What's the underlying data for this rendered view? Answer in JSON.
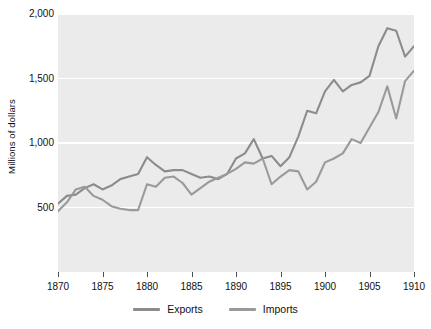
{
  "chart_data": {
    "type": "line",
    "title": "",
    "xlabel": "",
    "ylabel": "Millions of dollars",
    "xlim": [
      1870,
      1910
    ],
    "ylim": [
      0,
      2000
    ],
    "yticks": [
      500,
      1000,
      1500,
      2000
    ],
    "ytick_labels": [
      "500",
      "1,500",
      "1,000",
      "2,000"
    ],
    "xticks": [
      1870,
      1875,
      1880,
      1885,
      1890,
      1895,
      1900,
      1905,
      1910
    ],
    "grid": "horizontal-white-gridlines",
    "legend_position": "bottom-center",
    "plot_background": "#ebebeb",
    "x": [
      1870,
      1871,
      1872,
      1873,
      1874,
      1875,
      1876,
      1877,
      1878,
      1879,
      1880,
      1881,
      1882,
      1883,
      1884,
      1885,
      1886,
      1887,
      1888,
      1889,
      1890,
      1891,
      1892,
      1893,
      1894,
      1895,
      1896,
      1897,
      1898,
      1899,
      1900,
      1901,
      1902,
      1903,
      1904,
      1905,
      1906,
      1907,
      1908,
      1909,
      1910
    ],
    "series": [
      {
        "name": "Exports",
        "color": "#8c8c8c",
        "values": [
          530,
          590,
          600,
          650,
          680,
          640,
          670,
          720,
          740,
          760,
          890,
          830,
          780,
          790,
          790,
          760,
          730,
          740,
          720,
          760,
          880,
          920,
          1030,
          880,
          900,
          820,
          890,
          1050,
          1250,
          1230,
          1400,
          1490,
          1400,
          1450,
          1470,
          1520,
          1750,
          1890,
          1870,
          1670,
          1750
        ]
      },
      {
        "name": "Imports",
        "color": "#9a9a9a",
        "values": [
          470,
          540,
          640,
          660,
          590,
          560,
          510,
          490,
          480,
          480,
          680,
          660,
          730,
          740,
          690,
          600,
          650,
          700,
          730,
          760,
          800,
          850,
          840,
          880,
          680,
          740,
          790,
          780,
          640,
          700,
          850,
          880,
          920,
          1030,
          1000,
          1120,
          1240,
          1440,
          1190,
          1480,
          1560
        ]
      }
    ]
  },
  "axes": {
    "ylabel": "Millions of dollars",
    "ytick_labels": [
      "2,000",
      "1,500",
      "1,000",
      "500"
    ],
    "xtick_labels": [
      "1870",
      "1875",
      "1880",
      "1885",
      "1890",
      "1895",
      "1900",
      "1905",
      "1910"
    ]
  },
  "legend": {
    "items": [
      {
        "label": "Exports",
        "color": "#8c8c8c"
      },
      {
        "label": "Imports",
        "color": "#9a9a9a"
      }
    ]
  }
}
